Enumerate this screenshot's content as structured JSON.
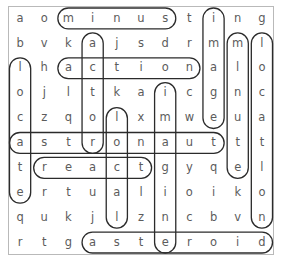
{
  "puzzle": {
    "type": "word-search",
    "columns": 11,
    "rows": 10,
    "grid": [
      [
        "a",
        "o",
        "m",
        "i",
        "n",
        "u",
        "s",
        "t",
        "i",
        "n",
        "g"
      ],
      [
        "b",
        "v",
        "k",
        "a",
        "j",
        "s",
        "d",
        "r",
        "m",
        "m",
        "l"
      ],
      [
        "l",
        "h",
        "a",
        "c",
        "t",
        "i",
        "o",
        "n",
        "a",
        "l",
        "o"
      ],
      [
        "o",
        "j",
        "l",
        "t",
        "k",
        "a",
        "i",
        "c",
        "g",
        "n",
        "c"
      ],
      [
        "c",
        "z",
        "q",
        "o",
        "l",
        "x",
        "m",
        "w",
        "e",
        "u",
        "a"
      ],
      [
        "a",
        "s",
        "t",
        "r",
        "o",
        "n",
        "a",
        "u",
        "t",
        "t",
        "t"
      ],
      [
        "t",
        "r",
        "e",
        "a",
        "c",
        "t",
        "g",
        "y",
        "q",
        "e",
        "l"
      ],
      [
        "e",
        "r",
        "t",
        "u",
        "a",
        "l",
        "i",
        "o",
        "i",
        "k",
        "o"
      ],
      [
        "q",
        "u",
        "k",
        "j",
        "l",
        "z",
        "n",
        "c",
        "b",
        "v",
        "n"
      ],
      [
        "r",
        "t",
        "g",
        "a",
        "s",
        "t",
        "e",
        "r",
        "o",
        "i",
        "d"
      ]
    ],
    "found_words": [
      {
        "word": "minus",
        "direction": "horizontal",
        "row": 0,
        "col_start": 2,
        "col_end": 6
      },
      {
        "word": "action",
        "direction": "horizontal",
        "row": 2,
        "col_start": 2,
        "col_end": 7
      },
      {
        "word": "astronaut",
        "direction": "horizontal",
        "row": 5,
        "col_start": 0,
        "col_end": 8
      },
      {
        "word": "react",
        "direction": "horizontal",
        "row": 6,
        "col_start": 1,
        "col_end": 5
      },
      {
        "word": "asteroid",
        "direction": "horizontal",
        "row": 9,
        "col_start": 3,
        "col_end": 10
      },
      {
        "word": "locate",
        "direction": "vertical",
        "col": 0,
        "row_start": 2,
        "row_end": 7
      },
      {
        "word": "actor",
        "direction": "vertical",
        "col": 3,
        "row_start": 1,
        "row_end": 5
      },
      {
        "word": "local",
        "direction": "vertical",
        "col": 4,
        "row_start": 4,
        "row_end": 8
      },
      {
        "word": "imagine",
        "direction": "vertical",
        "col": 6,
        "row_start": 3,
        "row_end": 9
      },
      {
        "word": "image",
        "direction": "vertical",
        "col": 8,
        "row_start": 0,
        "row_end": 4
      },
      {
        "word": "minute",
        "direction": "vertical",
        "col": 9,
        "row_start": 1,
        "row_end": 6
      },
      {
        "word": "location",
        "direction": "vertical",
        "col": 10,
        "row_start": 1,
        "row_end": 8
      }
    ],
    "colors": {
      "letter": "#5c5c5c",
      "mark_stroke": "#2b2b2b",
      "frame": "#b9b9b9",
      "background": "#ffffff"
    }
  }
}
